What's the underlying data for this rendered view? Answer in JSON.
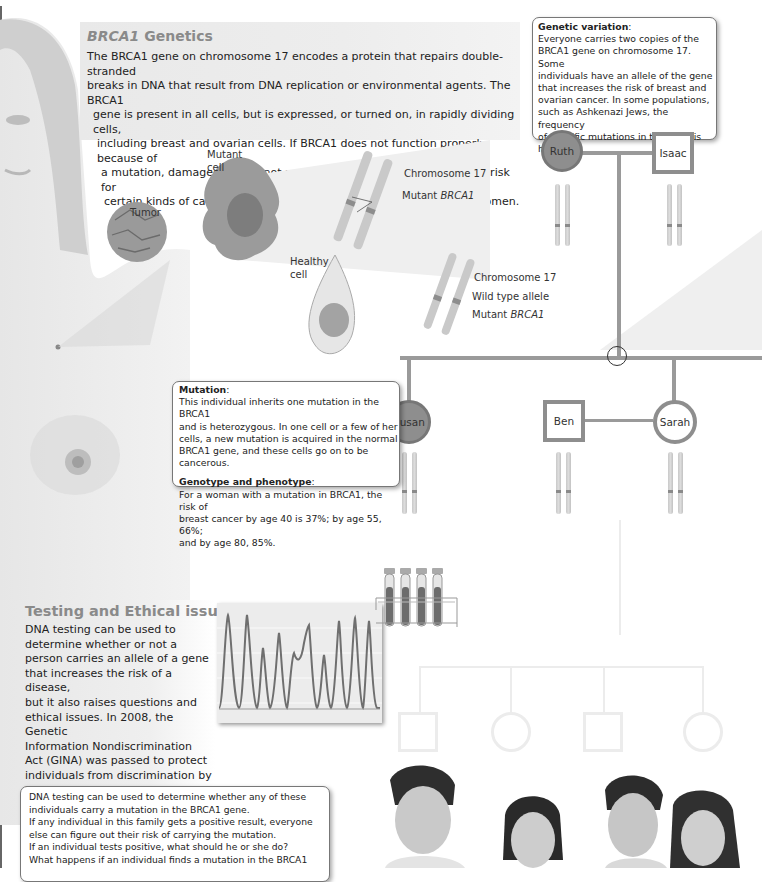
{
  "header": {
    "figure_number": "",
    "caption": ""
  },
  "brca1_panel": {
    "title_gene": "BRCA1",
    "title_rest": " Genetics",
    "paragraph": [
      {
        "t": "The "
      },
      {
        "i": "BRCA1"
      },
      {
        "t": " gene on chromosome 17 encodes a protein that repairs double-stranded breaks in DNA that result from DNA replication or environmental agents. The "
      },
      {
        "i": "BRCA1"
      },
      {
        "t": " gene is present in all cells, but is expressed, or turned on, in rapidly dividing cells, including breast and ovarian cells. If "
      },
      {
        "i": "BRCA1"
      },
      {
        "t": " does not function properly because of a mutation, damaged DNA is not repaired, which in turn increases the risk for certain kinds of cancers, particularly breast and ovarian cancers in women."
      }
    ],
    "lines": [
      "The BRCA1 gene on chromosome 17 encodes a protein that repairs double-stranded",
      "breaks in DNA that result from DNA replication or environmental agents.  The BRCA1",
      "gene is present in all cells, but is expressed, or turned on, in rapidly dividing cells,",
      "including breast and ovarian cells. If BRCA1 does not function properly because of",
      "a mutation, damaged DNA is not repaired, which in turn increases the risk for",
      "certain kinds of cancers, particularly breast and ovarian cancers in women."
    ]
  },
  "illustration_labels": {
    "tumor": "Tumor",
    "mutant_cell_line1": "Mutant",
    "mutant_cell_line2": "cell",
    "chromosome17_top": "Chromosome 17",
    "mutant_brca1_top_prefix": "Mutant ",
    "mutant_brca1_top_gene": "BRCA1",
    "healthy_cell_line1": "Healthy",
    "healthy_cell_line2": "cell",
    "chromosome17_bottom": "Chromosome 17",
    "wild_type_allele": "Wild type allele",
    "mutant_brca1_bottom_prefix": "Mutant ",
    "mutant_brca1_bottom_gene": "BRCA1"
  },
  "genetic_variation_callout": {
    "heading": "Genetic variation",
    "colon": ":",
    "lines": [
      "Everyone carries two copies of the",
      "BRCA1 gene on chromosome 17. Some",
      "individuals have an allele of the gene",
      "that increases the risk of breast and",
      "ovarian cancer. In some populations,",
      "such as Ashkenazi Jews, the frequency",
      "of specific mutations in the gene is high."
    ]
  },
  "mutation_callout": {
    "heading1": "Mutation",
    "colon": ":",
    "lines1": [
      "This individual inherits one mutation in the BRCA1",
      "and is heterozygous.  In one cell or a few of her",
      "cells, a new mutation is acquired in the normal",
      "BRCA1 gene, and these cells go on to be",
      "cancerous."
    ],
    "heading2": "Genotype and phenotype",
    "lines2": [
      "For a woman with a mutation in BRCA1, the risk of",
      "breast cancer by age 40 is 37%; by age 55, 66%;",
      "and by age 80, 85%."
    ]
  },
  "pedigree": {
    "colors": {
      "affected": "#8e8e8e",
      "line": "#9a9a9a",
      "faint": "#e8e8e8"
    },
    "people": [
      {
        "name": "Ruth",
        "sex": "female",
        "affected": true,
        "generation": 1
      },
      {
        "name": "Isaac",
        "sex": "male",
        "affected": false,
        "generation": 1
      },
      {
        "name": "Susan",
        "sex": "female",
        "affected": true,
        "generation": 2
      },
      {
        "name": "Ben",
        "sex": "male",
        "affected": false,
        "generation": 2
      },
      {
        "name": "Sarah",
        "sex": "female",
        "affected": false,
        "generation": 2
      }
    ],
    "generation3": [
      {
        "sex": "male"
      },
      {
        "sex": "female"
      },
      {
        "sex": "male"
      },
      {
        "sex": "female"
      }
    ]
  },
  "testing_panel": {
    "title": "Testing and Ethical issues",
    "lines": [
      "DNA testing can be used to",
      "determine whether or not a",
      "person carries an allele of a gene",
      "that increases the risk of a disease,",
      "but it also raises questions and",
      "ethical issues. In 2008, the Genetic",
      "Information Nondiscrimination",
      "Act (GINA) was passed to protect",
      "individuals from discrimination by",
      "insurance companies or employers",
      "based on genetic profile."
    ]
  },
  "questions_callout": {
    "lines": [
      "DNA testing can be used to determine whether any of these",
      "individuals carry a mutation in the BRCA1 gene.",
      "If any individual in this family gets a positive result, everyone",
      "else can figure out their risk of carrying the mutation.",
      "If an individual tests positive, what should he or she do?",
      "What happens if an individual finds a mutation in the BRCA1"
    ]
  },
  "icons": {
    "test_tubes": "test-tube-rack-icon",
    "sequencing_trace": "dna-sequencing-chromatogram",
    "photo": "four-young-adults-photo"
  }
}
